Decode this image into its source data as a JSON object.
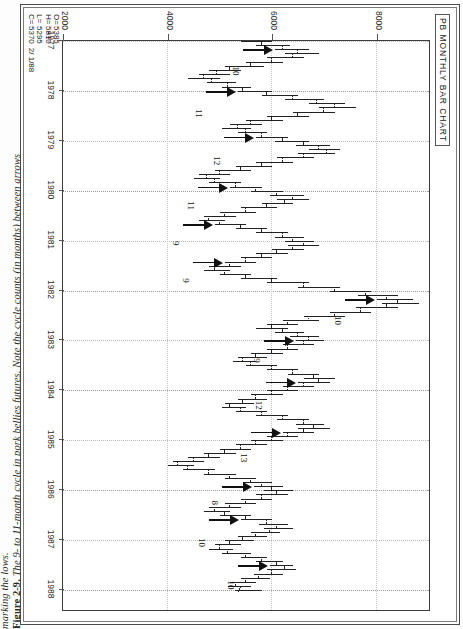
{
  "figure": {
    "number": "Figure 2-9.",
    "caption_line1": "The 9- to 11-month cycle in pork bellies futures. Note the cycle counts (in months) between arrows",
    "caption_line2": "marking the lows."
  },
  "chart": {
    "title": "PB MONTHLY BAR CHART",
    "zero_marker": "0",
    "quote": {
      "open_key": "O=",
      "high_key": "H=",
      "low_key": "L=",
      "close_key": "C=",
      "open": "5385",
      "high": "5810",
      "low": "5295",
      "close": "5370",
      "date": "2/ 1/88"
    }
  },
  "chart_data": {
    "type": "bar",
    "title": "PB MONTHLY BAR CHART",
    "subtitle": "Pork Bellies monthly OHLC bar chart, 1977–1988",
    "xlabel": "",
    "ylabel": "",
    "xlim": [
      1977,
      1988.4
    ],
    "ylim": [
      2000,
      9000
    ],
    "grid": true,
    "legend": null,
    "price_ticks": [
      8000,
      6000,
      4000,
      2000
    ],
    "year_ticks": [
      1977,
      1978,
      1979,
      1980,
      1981,
      1982,
      1983,
      1984,
      1985,
      1986,
      1987,
      1988
    ],
    "quote_readout": {
      "O": 5385,
      "H": 5810,
      "L": 5295,
      "C": 5370,
      "date": "2/ 1/88"
    },
    "cycle_counts": [
      10,
      11,
      12,
      11,
      9,
      9,
      10,
      9,
      12,
      13,
      8,
      10,
      10
    ],
    "cycle_count_note": "months between arrows marking the cycle lows",
    "low_arrows_years": [
      1977.2,
      1978.0,
      1978.9,
      1979.9,
      1980.7,
      1981.4,
      1982.2,
      1983.0,
      1983.8,
      1984.8,
      1985.9,
      1986.6,
      1987.5
    ],
    "bars": [
      {
        "t": 1977.0,
        "o": 5600,
        "h": 6000,
        "l": 5400,
        "c": 5800
      },
      {
        "t": 1977.08,
        "o": 5800,
        "h": 6350,
        "l": 5700,
        "c": 6200
      },
      {
        "t": 1977.17,
        "o": 6200,
        "h": 6700,
        "l": 6050,
        "c": 6500
      },
      {
        "t": 1977.25,
        "o": 6500,
        "h": 6900,
        "l": 6250,
        "c": 6400
      },
      {
        "t": 1977.33,
        "o": 6400,
        "h": 6600,
        "l": 5900,
        "c": 6000
      },
      {
        "t": 1977.42,
        "o": 6000,
        "h": 6200,
        "l": 5500,
        "c": 5600
      },
      {
        "t": 1977.5,
        "o": 5600,
        "h": 5850,
        "l": 5100,
        "c": 5200
      },
      {
        "t": 1977.58,
        "o": 5200,
        "h": 5400,
        "l": 4800,
        "c": 4950
      },
      {
        "t": 1977.67,
        "o": 4950,
        "h": 5200,
        "l": 4600,
        "c": 4700
      },
      {
        "t": 1977.75,
        "o": 4700,
        "h": 5000,
        "l": 4400,
        "c": 4850
      },
      {
        "t": 1977.83,
        "o": 4850,
        "h": 5300,
        "l": 4750,
        "c": 5150
      },
      {
        "t": 1977.92,
        "o": 5150,
        "h": 5600,
        "l": 5050,
        "c": 5450
      },
      {
        "t": 1978.0,
        "o": 5450,
        "h": 6000,
        "l": 5350,
        "c": 5900
      },
      {
        "t": 1978.08,
        "o": 5900,
        "h": 6500,
        "l": 5800,
        "c": 6400
      },
      {
        "t": 1978.17,
        "o": 6400,
        "h": 7000,
        "l": 6250,
        "c": 6850
      },
      {
        "t": 1978.25,
        "o": 6850,
        "h": 7400,
        "l": 6700,
        "c": 7200
      },
      {
        "t": 1978.33,
        "o": 7200,
        "h": 7600,
        "l": 6900,
        "c": 7000
      },
      {
        "t": 1978.42,
        "o": 7000,
        "h": 7200,
        "l": 6400,
        "c": 6500
      },
      {
        "t": 1978.5,
        "o": 6500,
        "h": 6700,
        "l": 5900,
        "c": 6000
      },
      {
        "t": 1978.58,
        "o": 6000,
        "h": 6200,
        "l": 5500,
        "c": 5600
      },
      {
        "t": 1978.67,
        "o": 5600,
        "h": 5800,
        "l": 5200,
        "c": 5350
      },
      {
        "t": 1978.75,
        "o": 5350,
        "h": 5600,
        "l": 5050,
        "c": 5500
      },
      {
        "t": 1978.83,
        "o": 5500,
        "h": 5900,
        "l": 5350,
        "c": 5800
      },
      {
        "t": 1978.92,
        "o": 5800,
        "h": 6300,
        "l": 5700,
        "c": 6200
      },
      {
        "t": 1979.0,
        "o": 6200,
        "h": 6700,
        "l": 6050,
        "c": 6600
      },
      {
        "t": 1979.08,
        "o": 6600,
        "h": 7100,
        "l": 6450,
        "c": 6900
      },
      {
        "t": 1979.17,
        "o": 6900,
        "h": 7300,
        "l": 6700,
        "c": 7050
      },
      {
        "t": 1979.25,
        "o": 7050,
        "h": 7200,
        "l": 6500,
        "c": 6600
      },
      {
        "t": 1979.33,
        "o": 6600,
        "h": 6800,
        "l": 6100,
        "c": 6200
      },
      {
        "t": 1979.42,
        "o": 6200,
        "h": 6400,
        "l": 5700,
        "c": 5800
      },
      {
        "t": 1979.5,
        "o": 5800,
        "h": 6000,
        "l": 5300,
        "c": 5400
      },
      {
        "t": 1979.58,
        "o": 5400,
        "h": 5600,
        "l": 4900,
        "c": 5000
      },
      {
        "t": 1979.67,
        "o": 5000,
        "h": 5200,
        "l": 4600,
        "c": 4750
      },
      {
        "t": 1979.75,
        "o": 4750,
        "h": 5000,
        "l": 4500,
        "c": 4900
      },
      {
        "t": 1979.83,
        "o": 4900,
        "h": 5400,
        "l": 4800,
        "c": 5300
      },
      {
        "t": 1979.92,
        "o": 5300,
        "h": 5800,
        "l": 5200,
        "c": 5700
      },
      {
        "t": 1980.0,
        "o": 5700,
        "h": 6200,
        "l": 5600,
        "c": 6100
      },
      {
        "t": 1980.08,
        "o": 6100,
        "h": 6600,
        "l": 5950,
        "c": 6400
      },
      {
        "t": 1980.17,
        "o": 6400,
        "h": 6700,
        "l": 6100,
        "c": 6250
      },
      {
        "t": 1980.25,
        "o": 6250,
        "h": 6400,
        "l": 5800,
        "c": 5900
      },
      {
        "t": 1980.33,
        "o": 5900,
        "h": 6100,
        "l": 5400,
        "c": 5500
      },
      {
        "t": 1980.42,
        "o": 5500,
        "h": 5700,
        "l": 5000,
        "c": 5100
      },
      {
        "t": 1980.5,
        "o": 5100,
        "h": 5300,
        "l": 4700,
        "c": 4800
      },
      {
        "t": 1980.58,
        "o": 4800,
        "h": 5100,
        "l": 4600,
        "c": 5000
      },
      {
        "t": 1980.67,
        "o": 5000,
        "h": 5500,
        "l": 4900,
        "c": 5400
      },
      {
        "t": 1980.75,
        "o": 5400,
        "h": 5900,
        "l": 5300,
        "c": 5800
      },
      {
        "t": 1980.83,
        "o": 5800,
        "h": 6300,
        "l": 5700,
        "c": 6200
      },
      {
        "t": 1980.92,
        "o": 6200,
        "h": 6600,
        "l": 6050,
        "c": 6400
      },
      {
        "t": 1981.0,
        "o": 6400,
        "h": 6800,
        "l": 6250,
        "c": 6600
      },
      {
        "t": 1981.08,
        "o": 6600,
        "h": 6900,
        "l": 6300,
        "c": 6400
      },
      {
        "t": 1981.17,
        "o": 6400,
        "h": 6600,
        "l": 6000,
        "c": 6100
      },
      {
        "t": 1981.25,
        "o": 6100,
        "h": 6300,
        "l": 5700,
        "c": 5800
      },
      {
        "t": 1981.33,
        "o": 5800,
        "h": 6000,
        "l": 5400,
        "c": 5500
      },
      {
        "t": 1981.42,
        "o": 5500,
        "h": 5700,
        "l": 5100,
        "c": 5200
      },
      {
        "t": 1981.5,
        "o": 5200,
        "h": 5400,
        "l": 4800,
        "c": 4900
      },
      {
        "t": 1981.58,
        "o": 4900,
        "h": 5200,
        "l": 4700,
        "c": 5100
      },
      {
        "t": 1981.67,
        "o": 5100,
        "h": 5600,
        "l": 5000,
        "c": 5500
      },
      {
        "t": 1981.75,
        "o": 5500,
        "h": 6100,
        "l": 5400,
        "c": 6000
      },
      {
        "t": 1981.83,
        "o": 6000,
        "h": 6700,
        "l": 5900,
        "c": 6600
      },
      {
        "t": 1981.92,
        "o": 6600,
        "h": 7300,
        "l": 6500,
        "c": 7200
      },
      {
        "t": 1982.0,
        "o": 7200,
        "h": 7900,
        "l": 7100,
        "c": 7800
      },
      {
        "t": 1982.08,
        "o": 7800,
        "h": 8400,
        "l": 7650,
        "c": 8200
      },
      {
        "t": 1982.17,
        "o": 8200,
        "h": 8700,
        "l": 8000,
        "c": 8400
      },
      {
        "t": 1982.25,
        "o": 8400,
        "h": 8800,
        "l": 8100,
        "c": 8200
      },
      {
        "t": 1982.33,
        "o": 8200,
        "h": 8400,
        "l": 7600,
        "c": 7700
      },
      {
        "t": 1982.42,
        "o": 7700,
        "h": 7900,
        "l": 7100,
        "c": 7200
      },
      {
        "t": 1982.5,
        "o": 7200,
        "h": 7400,
        "l": 6600,
        "c": 6700
      },
      {
        "t": 1982.58,
        "o": 6700,
        "h": 6900,
        "l": 6200,
        "c": 6300
      },
      {
        "t": 1982.67,
        "o": 6300,
        "h": 6500,
        "l": 5900,
        "c": 6000
      },
      {
        "t": 1982.75,
        "o": 6000,
        "h": 6300,
        "l": 5700,
        "c": 6200
      },
      {
        "t": 1982.83,
        "o": 6200,
        "h": 6600,
        "l": 6050,
        "c": 6500
      },
      {
        "t": 1982.92,
        "o": 6500,
        "h": 6900,
        "l": 6350,
        "c": 6700
      },
      {
        "t": 1983.0,
        "o": 6700,
        "h": 7000,
        "l": 6450,
        "c": 6600
      },
      {
        "t": 1983.08,
        "o": 6600,
        "h": 6800,
        "l": 6200,
        "c": 6300
      },
      {
        "t": 1983.17,
        "o": 6300,
        "h": 6500,
        "l": 5900,
        "c": 6000
      },
      {
        "t": 1983.25,
        "o": 6000,
        "h": 6200,
        "l": 5600,
        "c": 5700
      },
      {
        "t": 1983.33,
        "o": 5700,
        "h": 5900,
        "l": 5350,
        "c": 5450
      },
      {
        "t": 1983.42,
        "o": 5450,
        "h": 5700,
        "l": 5250,
        "c": 5600
      },
      {
        "t": 1983.5,
        "o": 5600,
        "h": 6100,
        "l": 5500,
        "c": 6000
      },
      {
        "t": 1983.58,
        "o": 6000,
        "h": 6500,
        "l": 5900,
        "c": 6400
      },
      {
        "t": 1983.67,
        "o": 6400,
        "h": 6900,
        "l": 6300,
        "c": 6800
      },
      {
        "t": 1983.75,
        "o": 6800,
        "h": 7200,
        "l": 6600,
        "c": 6900
      },
      {
        "t": 1983.83,
        "o": 6900,
        "h": 7100,
        "l": 6500,
        "c": 6600
      },
      {
        "t": 1983.92,
        "o": 6600,
        "h": 6800,
        "l": 6200,
        "c": 6300
      },
      {
        "t": 1984.0,
        "o": 6300,
        "h": 6500,
        "l": 5900,
        "c": 6000
      },
      {
        "t": 1984.08,
        "o": 6000,
        "h": 6200,
        "l": 5600,
        "c": 5700
      },
      {
        "t": 1984.17,
        "o": 5700,
        "h": 5900,
        "l": 5350,
        "c": 5450
      },
      {
        "t": 1984.25,
        "o": 5450,
        "h": 5650,
        "l": 5100,
        "c": 5200
      },
      {
        "t": 1984.33,
        "o": 5200,
        "h": 5500,
        "l": 5050,
        "c": 5400
      },
      {
        "t": 1984.42,
        "o": 5400,
        "h": 5900,
        "l": 5300,
        "c": 5800
      },
      {
        "t": 1984.5,
        "o": 5800,
        "h": 6300,
        "l": 5700,
        "c": 6200
      },
      {
        "t": 1984.58,
        "o": 6200,
        "h": 6700,
        "l": 6100,
        "c": 6600
      },
      {
        "t": 1984.67,
        "o": 6600,
        "h": 7000,
        "l": 6450,
        "c": 6800
      },
      {
        "t": 1984.75,
        "o": 6800,
        "h": 7100,
        "l": 6500,
        "c": 6600
      },
      {
        "t": 1984.83,
        "o": 6600,
        "h": 6800,
        "l": 6200,
        "c": 6300
      },
      {
        "t": 1984.92,
        "o": 6300,
        "h": 6500,
        "l": 5900,
        "c": 6000
      },
      {
        "t": 1985.0,
        "o": 6000,
        "h": 6200,
        "l": 5600,
        "c": 5700
      },
      {
        "t": 1985.08,
        "o": 5700,
        "h": 5900,
        "l": 5300,
        "c": 5400
      },
      {
        "t": 1985.17,
        "o": 5400,
        "h": 5600,
        "l": 5000,
        "c": 5100
      },
      {
        "t": 1985.25,
        "o": 5100,
        "h": 5300,
        "l": 4700,
        "c": 4800
      },
      {
        "t": 1985.33,
        "o": 4800,
        "h": 5000,
        "l": 4400,
        "c": 4500
      },
      {
        "t": 1985.42,
        "o": 4500,
        "h": 4700,
        "l": 4100,
        "c": 4200
      },
      {
        "t": 1985.5,
        "o": 4200,
        "h": 4500,
        "l": 4000,
        "c": 4400
      },
      {
        "t": 1985.58,
        "o": 4400,
        "h": 4900,
        "l": 4300,
        "c": 4800
      },
      {
        "t": 1985.67,
        "o": 4800,
        "h": 5300,
        "l": 4700,
        "c": 5200
      },
      {
        "t": 1985.75,
        "o": 5200,
        "h": 5700,
        "l": 5100,
        "c": 5600
      },
      {
        "t": 1985.83,
        "o": 5600,
        "h": 6000,
        "l": 5450,
        "c": 5800
      },
      {
        "t": 1985.92,
        "o": 5800,
        "h": 6200,
        "l": 5650,
        "c": 6000
      },
      {
        "t": 1986.0,
        "o": 6000,
        "h": 6400,
        "l": 5850,
        "c": 6100
      },
      {
        "t": 1986.08,
        "o": 6100,
        "h": 6300,
        "l": 5700,
        "c": 5800
      },
      {
        "t": 1986.17,
        "o": 5800,
        "h": 6000,
        "l": 5400,
        "c": 5500
      },
      {
        "t": 1986.25,
        "o": 5500,
        "h": 5700,
        "l": 5100,
        "c": 5200
      },
      {
        "t": 1986.33,
        "o": 5200,
        "h": 5400,
        "l": 4800,
        "c": 4900
      },
      {
        "t": 1986.42,
        "o": 4900,
        "h": 5200,
        "l": 4700,
        "c": 5100
      },
      {
        "t": 1986.5,
        "o": 5100,
        "h": 5600,
        "l": 5000,
        "c": 5500
      },
      {
        "t": 1986.58,
        "o": 5500,
        "h": 6000,
        "l": 5400,
        "c": 5900
      },
      {
        "t": 1986.67,
        "o": 5900,
        "h": 6300,
        "l": 5750,
        "c": 6100
      },
      {
        "t": 1986.75,
        "o": 6100,
        "h": 6400,
        "l": 5850,
        "c": 5950
      },
      {
        "t": 1986.83,
        "o": 5950,
        "h": 6150,
        "l": 5600,
        "c": 5700
      },
      {
        "t": 1986.92,
        "o": 5700,
        "h": 5900,
        "l": 5350,
        "c": 5450
      },
      {
        "t": 1987.0,
        "o": 5450,
        "h": 5650,
        "l": 5100,
        "c": 5200
      },
      {
        "t": 1987.08,
        "o": 5200,
        "h": 5400,
        "l": 4900,
        "c": 5000
      },
      {
        "t": 1987.17,
        "o": 5000,
        "h": 5250,
        "l": 4800,
        "c": 5150
      },
      {
        "t": 1987.25,
        "o": 5150,
        "h": 5600,
        "l": 5050,
        "c": 5500
      },
      {
        "t": 1987.33,
        "o": 5500,
        "h": 5900,
        "l": 5400,
        "c": 5800
      },
      {
        "t": 1987.42,
        "o": 5800,
        "h": 6200,
        "l": 5700,
        "c": 6100
      },
      {
        "t": 1987.5,
        "o": 6100,
        "h": 6400,
        "l": 5950,
        "c": 6250
      },
      {
        "t": 1987.58,
        "o": 6250,
        "h": 6450,
        "l": 5900,
        "c": 6000
      },
      {
        "t": 1987.67,
        "o": 6000,
        "h": 6200,
        "l": 5650,
        "c": 5750
      },
      {
        "t": 1987.75,
        "o": 5750,
        "h": 5950,
        "l": 5400,
        "c": 5500
      },
      {
        "t": 1987.83,
        "o": 5500,
        "h": 5700,
        "l": 5200,
        "c": 5300
      },
      {
        "t": 1987.92,
        "o": 5300,
        "h": 5600,
        "l": 5150,
        "c": 5400
      },
      {
        "t": 1988.0,
        "o": 5385,
        "h": 5810,
        "l": 5295,
        "c": 5370
      }
    ]
  }
}
